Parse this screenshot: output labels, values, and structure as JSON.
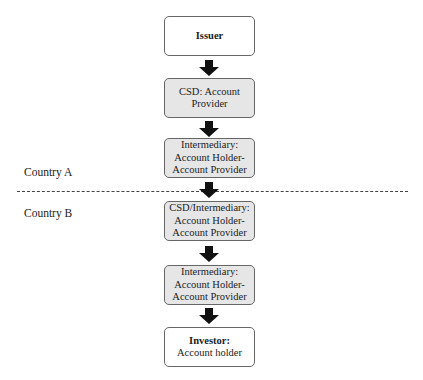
{
  "diagram": {
    "nodes": [
      {
        "id": "issuer",
        "lines": [
          "Issuer"
        ],
        "bold_first": true,
        "fill": "#ffffff"
      },
      {
        "id": "csd",
        "lines": [
          "CSD: Account",
          "Provider"
        ],
        "bold_first": false,
        "fill": "#e6e6e6"
      },
      {
        "id": "intermediary_a",
        "lines": [
          "Intermediary:",
          "Account Holder-",
          "Account Provider"
        ],
        "bold_first": false,
        "fill": "#e6e6e6"
      },
      {
        "id": "csd_intermediary_b",
        "lines": [
          "CSD/Intermediary:",
          "Account Holder-",
          "Account Provider"
        ],
        "bold_first": false,
        "fill": "#e6e6e6"
      },
      {
        "id": "intermediary_b",
        "lines": [
          "Intermediary:",
          "Account Holder-",
          "Account Provider"
        ],
        "bold_first": false,
        "fill": "#e6e6e6"
      },
      {
        "id": "investor",
        "lines": [
          "Investor:",
          "Account holder"
        ],
        "bold_first": true,
        "fill": "#ffffff"
      }
    ],
    "edges": [
      {
        "from": "issuer",
        "to": "csd"
      },
      {
        "from": "csd",
        "to": "intermediary_a"
      },
      {
        "from": "intermediary_a",
        "to": "csd_intermediary_b"
      },
      {
        "from": "csd_intermediary_b",
        "to": "intermediary_b"
      },
      {
        "from": "intermediary_b",
        "to": "investor"
      }
    ],
    "regions": {
      "country_a": "Country A",
      "country_b": "Country B"
    }
  }
}
